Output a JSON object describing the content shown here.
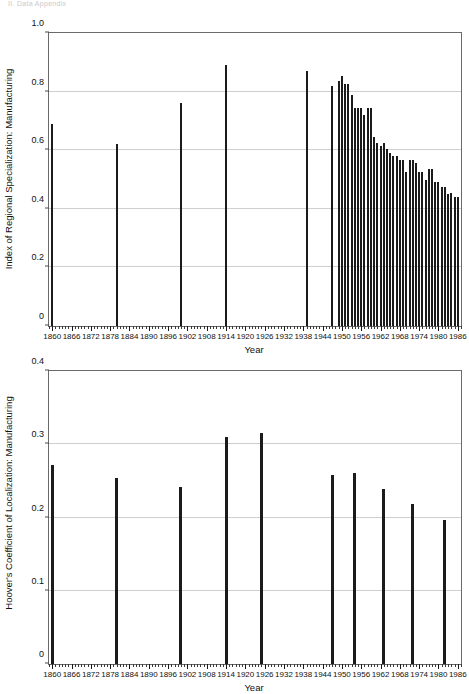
{
  "page": {
    "header_faint": "II.  Data Appendix"
  },
  "chart_data": [
    {
      "id": "regional-specialization",
      "type": "bar",
      "title": "",
      "ylabel": "Index of Regional Specialization: Manufacturing",
      "xlabel": "Year",
      "ylim": [
        0,
        1.0
      ],
      "xlim": [
        1859,
        1987
      ],
      "grid": true,
      "legend": "none",
      "yticks": [
        0,
        0.2,
        0.4,
        0.6,
        0.8,
        1.0
      ],
      "ytick_labels": [
        "0",
        "0.2",
        "0.4",
        "0.6",
        "0.8",
        "1.0"
      ],
      "xticks": [
        1860,
        1866,
        1872,
        1878,
        1884,
        1890,
        1896,
        1902,
        1908,
        1914,
        1920,
        1926,
        1932,
        1938,
        1944,
        1950,
        1956,
        1962,
        1968,
        1974,
        1980,
        1986
      ],
      "xtick_labels": [
        "1860",
        "1866",
        "1872",
        "1878",
        "1884",
        "1890",
        "1896",
        "1902",
        "1908",
        "1914",
        "1920",
        "1926",
        "1932",
        "1938",
        "1944",
        "1950",
        "1956",
        "1962",
        "1968",
        "1974",
        "1980",
        "1986"
      ],
      "x": [
        1860,
        1880,
        1900,
        1914,
        1939,
        1947,
        1949,
        1950,
        1951,
        1952,
        1953,
        1954,
        1955,
        1956,
        1957,
        1958,
        1959,
        1960,
        1961,
        1962,
        1963,
        1964,
        1965,
        1966,
        1967,
        1968,
        1969,
        1970,
        1971,
        1972,
        1973,
        1974,
        1975,
        1976,
        1977,
        1978,
        1979,
        1980,
        1981,
        1982,
        1983,
        1984,
        1985,
        1986
      ],
      "values": [
        0.69,
        0.62,
        0.76,
        0.89,
        0.87,
        0.82,
        0.835,
        0.855,
        0.825,
        0.825,
        0.79,
        0.745,
        0.745,
        0.745,
        0.72,
        0.745,
        0.745,
        0.645,
        0.625,
        0.615,
        0.625,
        0.605,
        0.59,
        0.58,
        0.58,
        0.565,
        0.565,
        0.525,
        0.565,
        0.565,
        0.555,
        0.525,
        0.525,
        0.5,
        0.535,
        0.535,
        0.49,
        0.49,
        0.475,
        0.475,
        0.45,
        0.455,
        0.44,
        0.44
      ]
    },
    {
      "id": "hoover-coefficient",
      "type": "bar",
      "title": "",
      "ylabel": "Hoover's Coefficient of Localization: Manufacturing",
      "xlabel": "Year",
      "ylim": [
        0,
        0.4
      ],
      "xlim": [
        1859,
        1987
      ],
      "grid": true,
      "legend": "none",
      "yticks": [
        0,
        0.1,
        0.2,
        0.3,
        0.4
      ],
      "ytick_labels": [
        "0",
        "0.1",
        "0.2",
        "0.3",
        "0.4"
      ],
      "xticks": [
        1860,
        1866,
        1872,
        1878,
        1884,
        1890,
        1896,
        1902,
        1908,
        1914,
        1920,
        1926,
        1932,
        1938,
        1944,
        1950,
        1956,
        1962,
        1968,
        1974,
        1980,
        1986
      ],
      "xtick_labels": [
        "1860",
        "1866",
        "1872",
        "1878",
        "1884",
        "1890",
        "1896",
        "1902",
        "1908",
        "1914",
        "1920",
        "1926",
        "1932",
        "1938",
        "1944",
        "1950",
        "1956",
        "1962",
        "1968",
        "1974",
        "1980",
        "1986"
      ],
      "x": [
        1860,
        1880,
        1900,
        1914,
        1925,
        1947,
        1954,
        1963,
        1972,
        1982
      ],
      "values": [
        0.272,
        0.254,
        0.241,
        0.31,
        0.316,
        0.258,
        0.261,
        0.239,
        0.219,
        0.196
      ]
    }
  ]
}
